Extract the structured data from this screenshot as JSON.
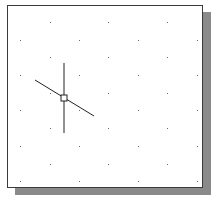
{
  "canvas": {
    "background": "#ffffff",
    "border_color": "#3a3a3a",
    "shadow_color": "#8a8a8a",
    "grid_color": "#6a6a6a",
    "grid_type": "isometric",
    "grid_rows": [
      {
        "y": 22,
        "xs": [
          50,
          108,
          167
        ]
      },
      {
        "y": 40,
        "xs": [
          20,
          79,
          138,
          197
        ]
      },
      {
        "y": 57,
        "xs": [
          50,
          108,
          167
        ]
      },
      {
        "y": 75,
        "xs": [
          20,
          79,
          138,
          197
        ]
      },
      {
        "y": 93,
        "xs": [
          50,
          108,
          167
        ]
      },
      {
        "y": 110,
        "xs": [
          20,
          79,
          138,
          197
        ]
      },
      {
        "y": 128,
        "xs": [
          50,
          108,
          167
        ]
      },
      {
        "y": 146,
        "xs": [
          20,
          79,
          138,
          197
        ]
      },
      {
        "y": 164,
        "xs": [
          50,
          108,
          167
        ]
      },
      {
        "y": 181,
        "xs": [
          20,
          79,
          138,
          197
        ]
      }
    ]
  },
  "cursor": {
    "type": "isometric-crosshair",
    "center": [
      64,
      98
    ],
    "color": "#222222",
    "vertical": {
      "x": 64,
      "y1": 63,
      "y2": 133
    },
    "diagonal": {
      "x1": 35,
      "y1": 80,
      "x2": 94,
      "y2": 116
    },
    "pickbox_size": 6
  }
}
